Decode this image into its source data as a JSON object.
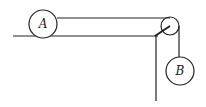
{
  "diagram": {
    "type": "pulley-system",
    "labels": {
      "block_a": "A",
      "block_b": "B"
    },
    "colors": {
      "stroke": "#222222",
      "background": "#ffffff"
    }
  }
}
